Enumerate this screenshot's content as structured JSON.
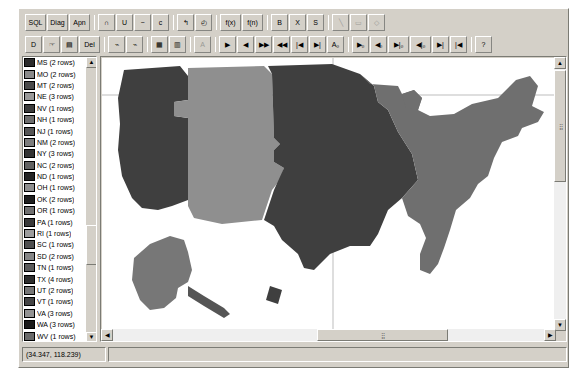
{
  "app": {
    "title": "Map Viewer"
  },
  "toolbar_row1": {
    "buttons": [
      {
        "name": "sql-button",
        "label": "SQL",
        "icon": "sql-icon",
        "disabled": false
      },
      {
        "name": "diagram-button",
        "label": "Diag",
        "icon": "diagram-icon",
        "disabled": false
      },
      {
        "name": "append-button",
        "label": "Apn",
        "icon": "append-icon",
        "disabled": false
      },
      {
        "name": "intersect-button",
        "label": "∩",
        "icon": "intersect-icon",
        "disabled": false
      },
      {
        "name": "union-button",
        "label": "U",
        "icon": "union-icon",
        "disabled": false
      },
      {
        "name": "difference-button",
        "label": "−",
        "icon": "difference-icon",
        "disabled": false
      },
      {
        "name": "complement-button",
        "label": "c",
        "icon": "complement-icon",
        "disabled": false
      },
      {
        "name": "undo-button",
        "label": "↰",
        "icon": "undo-icon",
        "disabled": false
      },
      {
        "name": "clock-button",
        "label": "◴",
        "icon": "clock-icon",
        "disabled": false
      },
      {
        "name": "function-button",
        "label": "f(x)",
        "icon": "function-icon",
        "disabled": false
      },
      {
        "name": "function-alt-button",
        "label": "f(n)",
        "icon": "function-alt-icon",
        "disabled": false
      },
      {
        "name": "bold-button",
        "label": "B",
        "icon": "bold-icon",
        "disabled": false
      },
      {
        "name": "delete-row-button",
        "label": "X",
        "icon": "delete-row-icon",
        "disabled": false
      },
      {
        "name": "select-button",
        "label": "S",
        "icon": "select-icon",
        "disabled": false
      },
      {
        "name": "line-tool-button",
        "label": "╲",
        "icon": "line-tool-icon",
        "disabled": true
      },
      {
        "name": "rectangle-tool-button",
        "label": "▭",
        "icon": "rectangle-tool-icon",
        "disabled": true
      },
      {
        "name": "polygon-tool-button",
        "label": "◇",
        "icon": "polygon-tool-icon",
        "disabled": true
      }
    ]
  },
  "toolbar_row2": {
    "buttons": [
      {
        "name": "new-button",
        "label": "D",
        "icon": "new-document-icon",
        "disabled": false
      },
      {
        "name": "open-button",
        "label": "☞",
        "icon": "open-folder-icon",
        "disabled": false
      },
      {
        "name": "save-button",
        "label": "▤",
        "icon": "save-disk-icon",
        "disabled": false
      },
      {
        "name": "delete-button",
        "label": "Del",
        "icon": "delete-icon",
        "disabled": false
      },
      {
        "name": "zoom-in-button",
        "label": "⌁",
        "icon": "zoom-in-icon",
        "disabled": false
      },
      {
        "name": "zoom-out-button",
        "label": "⌁",
        "icon": "zoom-out-icon",
        "disabled": false
      },
      {
        "name": "grid-view-button",
        "label": "▦",
        "icon": "grid-view-icon",
        "disabled": false
      },
      {
        "name": "table-view-button",
        "label": "▥",
        "icon": "table-view-icon",
        "disabled": false
      },
      {
        "name": "text-tool-button",
        "label": "A",
        "icon": "text-tool-icon",
        "disabled": true
      },
      {
        "name": "play-button",
        "label": "▶",
        "icon": "play-icon",
        "disabled": false
      },
      {
        "name": "prev-button",
        "label": "◀",
        "icon": "prev-icon",
        "disabled": false
      },
      {
        "name": "fast-forward-button",
        "label": "▶▶",
        "icon": "fast-forward-icon",
        "disabled": false
      },
      {
        "name": "rewind-button",
        "label": "◀◀",
        "icon": "rewind-icon",
        "disabled": false
      },
      {
        "name": "step-back-button",
        "label": "|◀",
        "icon": "step-back-icon",
        "disabled": false
      },
      {
        "name": "step-forward-button",
        "label": "▶|",
        "icon": "step-forward-icon",
        "disabled": false
      },
      {
        "name": "label-first-button",
        "label": "A₀",
        "icon": "label-first-icon",
        "disabled": false
      },
      {
        "name": "record-next-button",
        "label": "▶₀",
        "icon": "record-next-icon",
        "disabled": false
      },
      {
        "name": "record-prev-button",
        "label": "◀₀",
        "icon": "record-prev-icon",
        "disabled": false
      },
      {
        "name": "record-last-button",
        "label": "▶|₀",
        "icon": "record-last-icon",
        "disabled": false
      },
      {
        "name": "record-first-button",
        "label": "◀|₀",
        "icon": "record-first-icon",
        "disabled": false
      },
      {
        "name": "record-end-button",
        "label": "▶|",
        "icon": "record-end-icon",
        "disabled": false
      },
      {
        "name": "record-begin-button",
        "label": "|◀",
        "icon": "record-begin-icon",
        "disabled": false
      },
      {
        "name": "help-button",
        "label": "?",
        "icon": "help-icon",
        "disabled": false
      }
    ]
  },
  "legend": {
    "items": [
      {
        "label": "MS (2 rows)",
        "color": "#2b2b2b",
        "selected": false
      },
      {
        "label": "MO (2 rows)",
        "color": "#8a8a8a",
        "selected": false
      },
      {
        "label": "MT (2 rows)",
        "color": "#4a4a4a",
        "selected": false
      },
      {
        "label": "NE (3 rows)",
        "color": "#9a9a9a",
        "selected": false
      },
      {
        "label": "NV (1 rows)",
        "color": "#3c3c3c",
        "selected": false
      },
      {
        "label": "NH (1 rows)",
        "color": "#6e6e6e",
        "selected": false
      },
      {
        "label": "NJ (1 rows)",
        "color": "#555555",
        "selected": false
      },
      {
        "label": "NM (2 rows)",
        "color": "#7d7d7d",
        "selected": false
      },
      {
        "label": "NY (3 rows)",
        "color": "#333333",
        "selected": false
      },
      {
        "label": "NC (2 rows)",
        "color": "#626262",
        "selected": false
      },
      {
        "label": "ND (1 rows)",
        "color": "#252525",
        "selected": false
      },
      {
        "label": "OH (1 rows)",
        "color": "#8f8f8f",
        "selected": false
      },
      {
        "label": "OK (2 rows)",
        "color": "#1f1f1f",
        "selected": false
      },
      {
        "label": "OR (1 rows)",
        "color": "#717171",
        "selected": false
      },
      {
        "label": "PA (1 rows)",
        "color": "#3a3a3a",
        "selected": false
      },
      {
        "label": "RI (1 rows)",
        "color": "#9d9d9d",
        "selected": false
      },
      {
        "label": "SC (1 rows)",
        "color": "#4f4f4f",
        "selected": false
      },
      {
        "label": "SD (2 rows)",
        "color": "#868686",
        "selected": false
      },
      {
        "label": "TN (1 rows)",
        "color": "#5b5b5b",
        "selected": false
      },
      {
        "label": "TX (4 rows)",
        "color": "#2e2e2e",
        "selected": false
      },
      {
        "label": "UT (2 rows)",
        "color": "#777777",
        "selected": false
      },
      {
        "label": "VT (1 rows)",
        "color": "#454545",
        "selected": false
      },
      {
        "label": "VA (3 rows)",
        "color": "#939393",
        "selected": false
      },
      {
        "label": "WA (3 rows)",
        "color": "#1a1a1a",
        "selected": false
      },
      {
        "label": "WV (1 rows)",
        "color": "#6a6a6a",
        "selected": false
      },
      {
        "label": "WI (2 rows)",
        "color": "#a2a2a2",
        "selected": false
      },
      {
        "label": "WY (1 rows)",
        "color": "#404040",
        "selected": false
      },
      {
        "label": "Capital (50 ro",
        "color": "#d8d8d8",
        "selected": false
      },
      {
        "label": "HST (1 rows)",
        "color": "#3f3f3f",
        "selected": true
      },
      {
        "label": "AKST (1 rows)",
        "color": "#c8c8c8",
        "selected": true
      },
      {
        "label": "PST (10 rows)",
        "color": "#4d4d4d",
        "selected": true
      },
      {
        "label": "MST (17 rows)",
        "color": "#bdbdbd",
        "selected": true
      },
      {
        "label": "CST (36 rows)",
        "color": "#3a3a3a",
        "selected": true
      },
      {
        "label": "EST (29 rows)",
        "color": "#8c8c8c",
        "selected": true
      }
    ],
    "scroll_up_glyph": "▲",
    "scroll_down_glyph": "▼"
  },
  "map": {
    "background": "#ffffff",
    "guide_line_color": "#b9b9b9",
    "zones": [
      {
        "name": "pacific-zone",
        "color": "#3f3f3f"
      },
      {
        "name": "mountain-zone",
        "color": "#8f8f8f"
      },
      {
        "name": "central-zone",
        "color": "#3f3f3f"
      },
      {
        "name": "eastern-zone",
        "color": "#6f6f6f"
      },
      {
        "name": "texas-zone",
        "color": "#3f3f3f"
      },
      {
        "name": "alaska-zone",
        "color": "#777777"
      },
      {
        "name": "hawaii-zone",
        "color": "#3f3f3f"
      }
    ],
    "scroll": {
      "up_glyph": "▲",
      "down_glyph": "▼",
      "left_glyph": "◀",
      "right_glyph": "▶",
      "grip": "⣿"
    }
  },
  "statusbar": {
    "coordinates": "(34.347, 118.239)",
    "message": ""
  }
}
